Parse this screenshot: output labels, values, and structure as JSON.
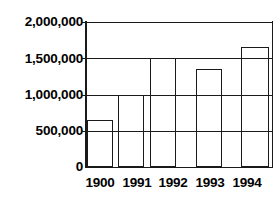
{
  "chart_data": {
    "type": "bar",
    "title": "",
    "subtitle": "",
    "xlabel": "",
    "ylabel": "",
    "grid": true,
    "legend": null,
    "categories": [
      "1900",
      "1991",
      "1992",
      "1993",
      "1994"
    ],
    "values": [
      650000,
      1000000,
      1500000,
      1350000,
      1650000
    ],
    "ylim": [
      0,
      2000000
    ],
    "ytick_values": [
      2000000,
      1500000,
      1000000,
      500000,
      0
    ],
    "ytick_labels": [
      "2,000,000",
      "1,500,000",
      "1,000,000",
      "500,000",
      "0"
    ],
    "xtick_labels": [
      "1900",
      "1991",
      "1992",
      "1993",
      "1994"
    ],
    "series": [
      {
        "name": "",
        "values": [
          650000,
          1000000,
          1500000,
          1350000,
          1650000
        ]
      }
    ],
    "bar_style": {
      "fill": "#ffffff",
      "edge": "#1a1a1a",
      "edge_width": 1.3
    },
    "colors": {
      "axis": "#1a1a1a",
      "grid": "#1a1a1a",
      "background": "#ffffff",
      "text": "#000000"
    }
  },
  "axis": {
    "y_ticks": [
      {
        "label": "2,000,000",
        "value": 2000000
      },
      {
        "label": "1,500,000",
        "value": 1500000
      },
      {
        "label": "1,000,000",
        "value": 1000000
      },
      {
        "label": "500,000",
        "value": 500000
      },
      {
        "label": "0",
        "value": 0
      }
    ],
    "x_ticks": [
      {
        "label": "1900"
      },
      {
        "label": "1991"
      },
      {
        "label": "1992"
      },
      {
        "label": "1993"
      },
      {
        "label": "1994"
      }
    ]
  },
  "bars": [
    {
      "category": "1900",
      "value": 650000
    },
    {
      "category": "1991",
      "value": 1000000
    },
    {
      "category": "1992",
      "value": 1500000
    },
    {
      "category": "1993",
      "value": 1350000
    },
    {
      "category": "1994",
      "value": 1650000
    }
  ]
}
